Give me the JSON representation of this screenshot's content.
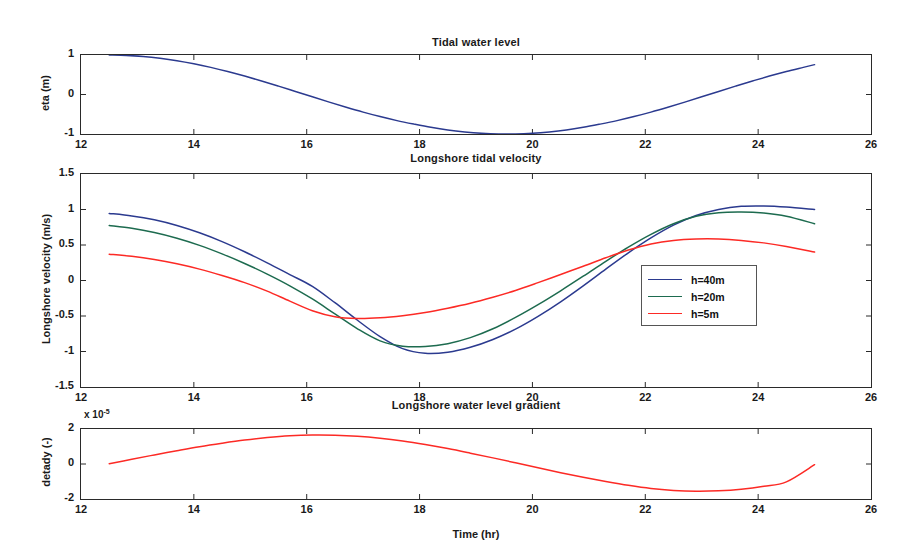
{
  "figure": {
    "width": 906,
    "height": 554,
    "background": "#ffffff",
    "xlabel": "Time (hr)"
  },
  "colors": {
    "h40": "#2b3a8f",
    "h20": "#1d6b4f",
    "h5": "#fc2a25",
    "axis": "#2a2a2a",
    "text": "#1a1a1a"
  },
  "legend": {
    "position": "inside-right-middle",
    "entries": [
      {
        "label": "h=40m",
        "color": "#2b3a8f"
      },
      {
        "label": "h=20m",
        "color": "#1d6b4f"
      },
      {
        "label": "h=5m",
        "color": "#fc2a25"
      }
    ]
  },
  "chart_data": [
    {
      "type": "line",
      "title": "Tidal water level",
      "xlabel": "",
      "ylabel": "eta (m)",
      "xlim": [
        12,
        26
      ],
      "ylim": [
        -1,
        1
      ],
      "xticks": [
        12,
        14,
        16,
        18,
        20,
        22,
        24,
        26
      ],
      "yticks": [
        -1,
        0,
        1
      ],
      "xticklabels": [
        "12",
        "14",
        "16",
        "18",
        "20",
        "22",
        "24",
        "26"
      ],
      "yticklabels": [
        "-1",
        "0",
        "1"
      ],
      "grid": false,
      "series": [
        {
          "name": "eta",
          "color": "#2b3a8f",
          "x": [
            12.5,
            12.8,
            13.1,
            13.4,
            13.7,
            14.0,
            14.3,
            14.6,
            14.9,
            15.2,
            15.5,
            15.8,
            16.1,
            16.4,
            16.7,
            17.0,
            17.3,
            17.6,
            17.9,
            18.2,
            18.5,
            18.8,
            19.1,
            19.4,
            19.7,
            20.0,
            20.3,
            20.6,
            20.9,
            21.2,
            21.5,
            21.8,
            22.1,
            22.4,
            22.7,
            23.0,
            23.3,
            23.6,
            23.9,
            24.2,
            24.5,
            24.8,
            25.0
          ],
          "y": [
            0.999,
            0.99,
            0.963,
            0.918,
            0.857,
            0.779,
            0.687,
            0.582,
            0.466,
            0.342,
            0.212,
            0.077,
            -0.059,
            -0.193,
            -0.323,
            -0.446,
            -0.559,
            -0.661,
            -0.75,
            -0.832,
            -0.899,
            -0.948,
            -0.982,
            -0.999,
            -0.999,
            -0.982,
            -0.948,
            -0.899,
            -0.832,
            -0.75,
            -0.661,
            -0.559,
            -0.446,
            -0.323,
            -0.193,
            -0.059,
            0.077,
            0.212,
            0.342,
            0.466,
            0.582,
            0.687,
            0.756
          ]
        }
      ]
    },
    {
      "type": "line",
      "title": "Longshore tidal velocity",
      "xlabel": "",
      "ylabel": "Longshore velocity (m/s)",
      "xlim": [
        12,
        26
      ],
      "ylim": [
        -1.5,
        1.5
      ],
      "xticks": [
        12,
        14,
        16,
        18,
        20,
        22,
        24,
        26
      ],
      "yticks": [
        -1.5,
        -1,
        -0.5,
        0,
        0.5,
        1,
        1.5
      ],
      "xticklabels": [
        "12",
        "14",
        "16",
        "18",
        "20",
        "22",
        "24",
        "26"
      ],
      "yticklabels": [
        "-1.5",
        "-1",
        "-0.5",
        "0",
        "0.5",
        "1",
        "1.5"
      ],
      "grid": false,
      "series": [
        {
          "name": "h=40m",
          "color": "#2b3a8f",
          "x": [
            12.5,
            12.9,
            13.3,
            13.7,
            14.1,
            14.5,
            14.9,
            15.3,
            15.7,
            16.1,
            16.5,
            16.9,
            17.3,
            17.7,
            18.1,
            18.5,
            18.9,
            19.3,
            19.7,
            20.1,
            20.5,
            20.9,
            21.3,
            21.7,
            22.1,
            22.5,
            22.9,
            23.3,
            23.7,
            24.1,
            24.5,
            25.0
          ],
          "y": [
            0.945,
            0.91,
            0.855,
            0.775,
            0.672,
            0.548,
            0.405,
            0.248,
            0.083,
            -0.083,
            -0.313,
            -0.56,
            -0.79,
            -0.96,
            -1.025,
            -1.01,
            -0.94,
            -0.83,
            -0.685,
            -0.505,
            -0.3,
            -0.075,
            0.16,
            0.39,
            0.6,
            0.78,
            0.915,
            1.0,
            1.045,
            1.05,
            1.035,
            1.0
          ]
        },
        {
          "name": "h=20m",
          "color": "#1d6b4f",
          "x": [
            12.5,
            12.9,
            13.3,
            13.7,
            14.1,
            14.5,
            14.9,
            15.3,
            15.7,
            16.1,
            16.5,
            16.9,
            17.3,
            17.7,
            18.1,
            18.5,
            18.9,
            19.3,
            19.7,
            20.1,
            20.5,
            20.9,
            21.3,
            21.7,
            22.1,
            22.5,
            22.9,
            23.3,
            23.7,
            24.1,
            24.5,
            25.0
          ],
          "y": [
            0.775,
            0.735,
            0.675,
            0.595,
            0.495,
            0.375,
            0.24,
            0.09,
            -0.075,
            -0.26,
            -0.47,
            -0.68,
            -0.85,
            -0.925,
            -0.93,
            -0.89,
            -0.805,
            -0.68,
            -0.52,
            -0.34,
            -0.145,
            0.06,
            0.27,
            0.47,
            0.65,
            0.8,
            0.905,
            0.955,
            0.965,
            0.95,
            0.905,
            0.8
          ]
        },
        {
          "name": "h=5m",
          "color": "#fc2a25",
          "x": [
            12.5,
            12.9,
            13.3,
            13.7,
            14.1,
            14.5,
            14.9,
            15.3,
            15.7,
            16.1,
            16.5,
            16.9,
            17.3,
            17.7,
            18.1,
            18.5,
            18.9,
            19.3,
            19.7,
            20.1,
            20.5,
            20.9,
            21.3,
            21.7,
            22.1,
            22.5,
            22.9,
            23.3,
            23.7,
            24.1,
            24.5,
            25.0
          ],
          "y": [
            0.37,
            0.34,
            0.295,
            0.235,
            0.16,
            0.07,
            -0.03,
            -0.15,
            -0.29,
            -0.425,
            -0.51,
            -0.535,
            -0.525,
            -0.495,
            -0.45,
            -0.39,
            -0.32,
            -0.235,
            -0.14,
            -0.03,
            0.085,
            0.2,
            0.32,
            0.43,
            0.515,
            0.565,
            0.585,
            0.585,
            0.565,
            0.53,
            0.48,
            0.4
          ]
        }
      ]
    },
    {
      "type": "line",
      "title": "Longshore water level gradient",
      "xlabel": "Time (hr)",
      "ylabel": "detady (-)",
      "exponent_label": "x 10",
      "exponent_power": "-5",
      "xlim": [
        12,
        26
      ],
      "ylim": [
        -2,
        2
      ],
      "xticks": [
        12,
        14,
        16,
        18,
        20,
        22,
        24,
        26
      ],
      "yticks": [
        -2,
        0,
        2
      ],
      "xticklabels": [
        "12",
        "14",
        "16",
        "18",
        "20",
        "22",
        "24",
        "26"
      ],
      "yticklabels": [
        "-2",
        "0",
        "2"
      ],
      "grid": false,
      "series": [
        {
          "name": "detady",
          "color": "#fc2a25",
          "x": [
            12.5,
            12.9,
            13.3,
            13.7,
            14.1,
            14.5,
            14.9,
            15.3,
            15.7,
            16.1,
            16.5,
            16.9,
            17.3,
            17.7,
            18.1,
            18.5,
            18.9,
            19.3,
            19.7,
            20.1,
            20.5,
            20.9,
            21.3,
            21.7,
            22.1,
            22.5,
            22.9,
            23.3,
            23.7,
            24.1,
            24.5,
            25.0
          ],
          "y": [
            0.02,
            0.27,
            0.52,
            0.76,
            0.99,
            1.19,
            1.37,
            1.51,
            1.61,
            1.655,
            1.645,
            1.585,
            1.47,
            1.31,
            1.11,
            0.88,
            0.62,
            0.35,
            0.07,
            -0.22,
            -0.5,
            -0.76,
            -1.0,
            -1.22,
            -1.4,
            -1.51,
            -1.555,
            -1.53,
            -1.44,
            -1.27,
            -1.02,
            -0.04
          ]
        }
      ]
    }
  ],
  "axes_boxes": [
    {
      "left": 80,
      "top": 54,
      "width": 792,
      "height": 81
    },
    {
      "left": 80,
      "top": 173,
      "width": 792,
      "height": 215
    },
    {
      "left": 80,
      "top": 428,
      "width": 792,
      "height": 72
    }
  ]
}
